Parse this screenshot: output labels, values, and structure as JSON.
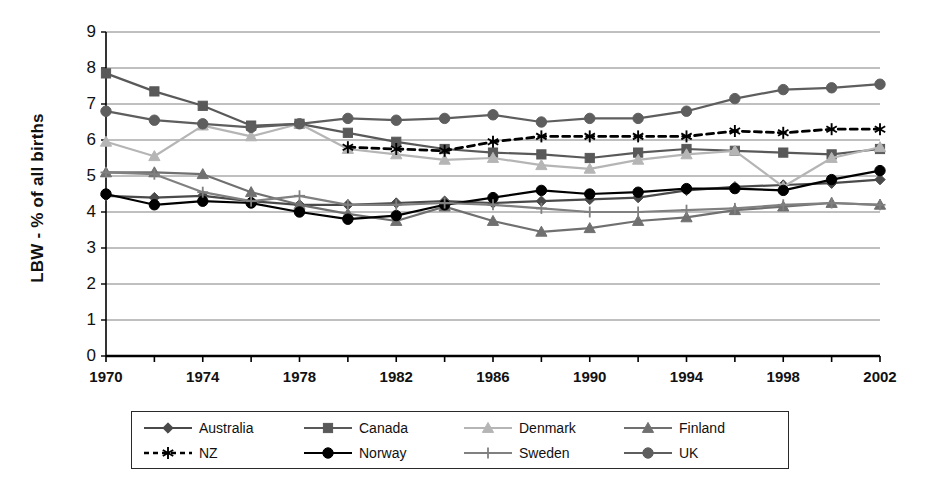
{
  "chart_data": {
    "type": "line",
    "title": "",
    "xlabel": "",
    "ylabel": "LBW - % of all births",
    "xlim": [
      1970,
      2002
    ],
    "ylim": [
      0,
      9
    ],
    "grid": true,
    "legend_position": "bottom",
    "x_tick_labels": [
      "1970",
      "1974",
      "1978",
      "1982",
      "1986",
      "1990",
      "1994",
      "1998",
      "2002"
    ],
    "x_tick_values": [
      1970,
      1974,
      1978,
      1982,
      1986,
      1990,
      1994,
      1998,
      2002
    ],
    "x_minor_tick_values": [
      1972,
      1976,
      1980,
      1984,
      1988,
      1992,
      1996,
      2000
    ],
    "y_tick_labels": [
      "0",
      "1",
      "2",
      "3",
      "4",
      "5",
      "6",
      "7",
      "8",
      "9"
    ],
    "y_tick_values": [
      0,
      1,
      2,
      3,
      4,
      5,
      6,
      7,
      8,
      9
    ],
    "x": [
      1970,
      1972,
      1974,
      1976,
      1978,
      1980,
      1982,
      1984,
      1986,
      1988,
      1990,
      1992,
      1994,
      1996,
      1998,
      2000,
      2002
    ],
    "series": [
      {
        "name": "Australia",
        "marker": "diamond",
        "color": "#4a4a4a",
        "dash": false,
        "values": [
          4.45,
          4.4,
          4.45,
          4.3,
          4.2,
          4.2,
          4.25,
          4.3,
          4.25,
          4.3,
          4.35,
          4.4,
          4.6,
          4.7,
          4.75,
          4.8,
          4.9
        ]
      },
      {
        "name": "Canada",
        "marker": "square",
        "color": "#595959",
        "dash": false,
        "values": [
          7.85,
          7.35,
          6.95,
          6.4,
          6.45,
          6.2,
          5.95,
          5.75,
          5.65,
          5.6,
          5.5,
          5.65,
          5.75,
          5.7,
          5.65,
          5.6,
          5.75
        ]
      },
      {
        "name": "Denmark",
        "marker": "triangle",
        "color": "#b5b5b5",
        "dash": false,
        "values": [
          5.95,
          5.55,
          6.4,
          6.1,
          6.45,
          5.75,
          5.6,
          5.45,
          5.5,
          5.3,
          5.2,
          5.45,
          5.6,
          5.7,
          4.7,
          5.5,
          5.8
        ]
      },
      {
        "name": "Finland",
        "marker": "triangle",
        "color": "#707070",
        "dash": false,
        "values": [
          5.1,
          5.1,
          5.05,
          4.55,
          4.2,
          3.95,
          3.75,
          4.15,
          3.75,
          3.45,
          3.55,
          3.75,
          3.85,
          4.05,
          4.15,
          4.25,
          4.2
        ]
      },
      {
        "name": "NZ",
        "marker": "asterisk",
        "color": "#000000",
        "dash": true,
        "values": [
          null,
          null,
          null,
          null,
          null,
          5.8,
          5.75,
          5.7,
          5.95,
          6.1,
          6.1,
          6.1,
          6.1,
          6.25,
          6.2,
          6.3,
          6.3
        ]
      },
      {
        "name": "Norway",
        "marker": "circle",
        "color": "#000000",
        "dash": false,
        "values": [
          4.5,
          4.2,
          4.3,
          4.25,
          4.0,
          3.8,
          3.9,
          4.2,
          4.4,
          4.6,
          4.5,
          4.55,
          4.65,
          4.65,
          4.6,
          4.9,
          5.15
        ]
      },
      {
        "name": "Sweden",
        "marker": "plus",
        "color": "#808080",
        "dash": false,
        "values": [
          5.1,
          5.05,
          4.55,
          4.3,
          4.45,
          4.2,
          4.2,
          4.25,
          4.2,
          4.1,
          4.0,
          4.0,
          4.05,
          4.1,
          4.2,
          4.25,
          4.2
        ]
      },
      {
        "name": "UK",
        "marker": "circle",
        "color": "#5e5e5e",
        "dash": false,
        "values": [
          6.8,
          6.55,
          6.45,
          6.35,
          6.45,
          6.6,
          6.55,
          6.6,
          6.7,
          6.5,
          6.6,
          6.6,
          6.8,
          7.15,
          7.4,
          7.45,
          7.55
        ]
      }
    ]
  },
  "legend": {
    "items": [
      {
        "label": "Australia",
        "marker": "diamond",
        "color": "#4a4a4a",
        "dash": false
      },
      {
        "label": "Canada",
        "marker": "square",
        "color": "#595959",
        "dash": false
      },
      {
        "label": "Denmark",
        "marker": "triangle",
        "color": "#b5b5b5",
        "dash": false
      },
      {
        "label": "Finland",
        "marker": "triangle",
        "color": "#707070",
        "dash": false
      },
      {
        "label": "NZ",
        "marker": "asterisk",
        "color": "#000000",
        "dash": true
      },
      {
        "label": "Norway",
        "marker": "circle",
        "color": "#000000",
        "dash": false
      },
      {
        "label": "Sweden",
        "marker": "plus",
        "color": "#808080",
        "dash": false
      },
      {
        "label": "UK",
        "marker": "circle",
        "color": "#5e5e5e",
        "dash": false
      }
    ]
  },
  "style": {
    "grid_color": "#808080",
    "axis_color": "#000000",
    "background": "#ffffff"
  }
}
